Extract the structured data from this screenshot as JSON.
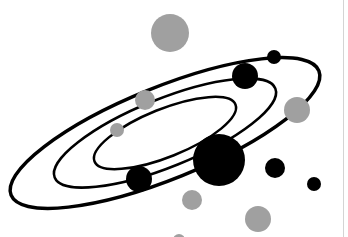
{
  "illustration": {
    "subject": "orbit-diagram",
    "colors": {
      "background": "#ffffff",
      "orbit": "#000000",
      "dark_body": "#000000",
      "light_body": "#a0a0a0",
      "edge_line": "#d4d4d4"
    },
    "orbit_center": [
      165,
      133
    ],
    "orbit_rotation_deg": -22,
    "orbits": [
      {
        "name": "outer-orbit",
        "rx": 166,
        "ry": 46,
        "stroke_width": 3.5
      },
      {
        "name": "middle-orbit",
        "rx": 119,
        "ry": 34,
        "stroke_width": 2.5
      },
      {
        "name": "inner-orbit",
        "rx": 76,
        "ry": 24,
        "stroke_width": 2.5
      }
    ],
    "bodies": [
      {
        "name": "gray-body-top",
        "cx": 170,
        "cy": 33,
        "r": 19,
        "tone": "light"
      },
      {
        "name": "black-body-top-small",
        "cx": 274,
        "cy": 57,
        "r": 7,
        "tone": "dark"
      },
      {
        "name": "black-body-upper",
        "cx": 245,
        "cy": 76,
        "r": 13,
        "tone": "dark"
      },
      {
        "name": "gray-body-right",
        "cx": 297,
        "cy": 110,
        "r": 13,
        "tone": "light"
      },
      {
        "name": "gray-body-mid",
        "cx": 145,
        "cy": 100,
        "r": 10,
        "tone": "light"
      },
      {
        "name": "gray-body-small",
        "cx": 117,
        "cy": 130,
        "r": 7,
        "tone": "light"
      },
      {
        "name": "black-body-large",
        "cx": 219,
        "cy": 160,
        "r": 26,
        "tone": "dark"
      },
      {
        "name": "black-body-lower-left",
        "cx": 139,
        "cy": 179,
        "r": 13,
        "tone": "dark"
      },
      {
        "name": "black-body-right",
        "cx": 275,
        "cy": 168,
        "r": 10,
        "tone": "dark"
      },
      {
        "name": "black-body-far-right",
        "cx": 314,
        "cy": 184,
        "r": 7,
        "tone": "dark"
      },
      {
        "name": "gray-body-lower",
        "cx": 192,
        "cy": 200,
        "r": 10,
        "tone": "light"
      },
      {
        "name": "gray-body-bottom-right",
        "cx": 258,
        "cy": 219,
        "r": 13,
        "tone": "light"
      },
      {
        "name": "gray-body-bottom-partial",
        "cx": 179,
        "cy": 240,
        "r": 6,
        "tone": "light"
      }
    ]
  }
}
